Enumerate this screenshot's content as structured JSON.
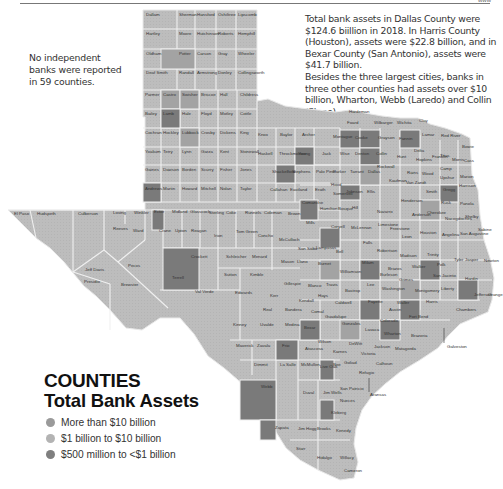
{
  "header": {
    "page_mark": "www"
  },
  "notes": {
    "left": "No independent banks were reported in 59 counties.",
    "right_p1": "Total bank assets in Dallas County were $124.6 biillion in 2018. In Harris County (Houston), assets were $22.8 billion, and in Bexar County (San Antonio), assets were $41.7 billion.",
    "right_p2": "Besides the three largest cities, banks in three other counties had assets over $10 billion, Wharton, Webb (Laredo) and Collin (Plano)."
  },
  "legend": {
    "title": "COUNTIES",
    "subtitle": "Total Bank Assets",
    "items": [
      {
        "label": "More than $10 billion",
        "color": "#9a9a9a"
      },
      {
        "label": "$1 billion to $10 billion",
        "color": "#b3b3b3"
      },
      {
        "label": "$500 million to <$1 billion",
        "color": "#7f7f7f"
      }
    ]
  },
  "colors": {
    "base": "#bdbdbd",
    "mid": "#a3a3a3",
    "dark": "#7a7a7a",
    "border": "#f2f2f2"
  },
  "map": {
    "panhandle_rows": [
      [
        "Dallam",
        "Sherman",
        "Hansford",
        "Ochiltree",
        "Lipscomb"
      ],
      [
        "Hartley",
        "Moore",
        "Hutchinson",
        "Roberts",
        "Hemphill"
      ],
      [
        "Oldham",
        "Potter",
        "Carson",
        "Gray",
        "Wheeler"
      ],
      [
        "Deaf Smith",
        "Randall",
        "Armstrong",
        "Donley",
        "Collingsworth"
      ],
      [
        "Parmer",
        "Castro",
        "Swisher",
        "Briscoe",
        "Hall",
        "Childress"
      ],
      [
        "Bailey",
        "Lamb",
        "Hale",
        "Floyd",
        "Motley",
        "Cottle"
      ],
      [
        "Cochran",
        "Hockley",
        "Lubbock",
        "Crosby",
        "Dickens",
        "King"
      ],
      [
        "Yoakum",
        "Terry",
        "Lynn",
        "Garza",
        "Kent",
        "Stonewall"
      ],
      [
        "Gaines",
        "Dawson",
        "Borden",
        "Scurry",
        "Fisher",
        "Jones"
      ],
      [
        "Andrews",
        "Martin",
        "Howard",
        "Mitchell",
        "Nolan",
        "Taylor"
      ]
    ],
    "labels": [
      {
        "name": "Hardeman",
        "x": 349,
        "y": 113
      },
      {
        "name": "Foard",
        "x": 347,
        "y": 124
      },
      {
        "name": "Wilbarger",
        "x": 374,
        "y": 124
      },
      {
        "name": "Wichita",
        "x": 397,
        "y": 124
      },
      {
        "name": "Clay",
        "x": 419,
        "y": 122
      },
      {
        "name": "Knox",
        "x": 258,
        "y": 136
      },
      {
        "name": "Baylor",
        "x": 280,
        "y": 136
      },
      {
        "name": "Archer",
        "x": 302,
        "y": 136
      },
      {
        "name": "Haskell",
        "x": 258,
        "y": 155
      },
      {
        "name": "Throckmorton",
        "x": 279,
        "y": 155
      },
      {
        "name": "Young",
        "x": 298,
        "y": 155
      },
      {
        "name": "Jack",
        "x": 322,
        "y": 155
      },
      {
        "name": "Wise",
        "x": 340,
        "y": 155
      },
      {
        "name": "Shackelford",
        "x": 272,
        "y": 173
      },
      {
        "name": "Stephens",
        "x": 292,
        "y": 173
      },
      {
        "name": "Palo Pinto",
        "x": 316,
        "y": 173
      },
      {
        "name": "Parker",
        "x": 333,
        "y": 173
      },
      {
        "name": "Tarrant",
        "x": 350,
        "y": 173
      },
      {
        "name": "Dallas",
        "x": 368,
        "y": 173
      },
      {
        "name": "Callahan",
        "x": 270,
        "y": 191
      },
      {
        "name": "Eastland",
        "x": 290,
        "y": 191
      },
      {
        "name": "Erath",
        "x": 315,
        "y": 191
      },
      {
        "name": "Montague",
        "x": 333,
        "y": 138
      },
      {
        "name": "Cooke",
        "x": 355,
        "y": 139
      },
      {
        "name": "Grayson",
        "x": 378,
        "y": 139
      },
      {
        "name": "Fannin",
        "x": 399,
        "y": 140
      },
      {
        "name": "Lamar",
        "x": 422,
        "y": 136
      },
      {
        "name": "Red River",
        "x": 441,
        "y": 137
      },
      {
        "name": "Bowie",
        "x": 462,
        "y": 148
      },
      {
        "name": "Denton",
        "x": 355,
        "y": 155
      },
      {
        "name": "Collin",
        "x": 376,
        "y": 155
      },
      {
        "name": "Hunt",
        "x": 397,
        "y": 158
      },
      {
        "name": "Delta",
        "x": 414,
        "y": 152
      },
      {
        "name": "Hopkins",
        "x": 416,
        "y": 161
      },
      {
        "name": "Franklin",
        "x": 432,
        "y": 158
      },
      {
        "name": "Titus",
        "x": 440,
        "y": 157
      },
      {
        "name": "Morris",
        "x": 452,
        "y": 161
      },
      {
        "name": "Cass",
        "x": 464,
        "y": 162
      },
      {
        "name": "Rockwall",
        "x": 377,
        "y": 168
      },
      {
        "name": "Kaufman",
        "x": 389,
        "y": 182
      },
      {
        "name": "Van Zandt",
        "x": 406,
        "y": 184
      },
      {
        "name": "Rains",
        "x": 407,
        "y": 174
      },
      {
        "name": "Wood",
        "x": 422,
        "y": 175
      },
      {
        "name": "Camp",
        "x": 440,
        "y": 170
      },
      {
        "name": "Upshur",
        "x": 440,
        "y": 179
      },
      {
        "name": "Marion",
        "x": 460,
        "y": 178
      },
      {
        "name": "Harrison",
        "x": 459,
        "y": 187
      },
      {
        "name": "Gregg",
        "x": 443,
        "y": 191
      },
      {
        "name": "Smith",
        "x": 426,
        "y": 193
      },
      {
        "name": "Ellis",
        "x": 367,
        "y": 193
      },
      {
        "name": "Johnson",
        "x": 346,
        "y": 193
      },
      {
        "name": "Hood",
        "x": 331,
        "y": 186
      },
      {
        "name": "Somervell",
        "x": 333,
        "y": 195
      },
      {
        "name": "Henderson",
        "x": 401,
        "y": 202
      },
      {
        "name": "Navarro",
        "x": 377,
        "y": 213
      },
      {
        "name": "Hill",
        "x": 352,
        "y": 209
      },
      {
        "name": "Rusk",
        "x": 441,
        "y": 204
      },
      {
        "name": "Panola",
        "x": 460,
        "y": 205
      },
      {
        "name": "Anderson",
        "x": 412,
        "y": 216
      },
      {
        "name": "Cherokee",
        "x": 427,
        "y": 214
      },
      {
        "name": "Nacogdoches",
        "x": 445,
        "y": 220
      },
      {
        "name": "Shelby",
        "x": 465,
        "y": 218
      },
      {
        "name": "El Paso",
        "x": 14,
        "y": 215
      },
      {
        "name": "Hudspeth",
        "x": 37,
        "y": 215
      },
      {
        "name": "Culberson",
        "x": 78,
        "y": 215
      },
      {
        "name": "Loving",
        "x": 113,
        "y": 214
      },
      {
        "name": "Winkler",
        "x": 134,
        "y": 214
      },
      {
        "name": "Ector",
        "x": 154,
        "y": 213
      },
      {
        "name": "Midland",
        "x": 172,
        "y": 213
      },
      {
        "name": "Glasscock",
        "x": 190,
        "y": 213
      },
      {
        "name": "Sterling",
        "x": 209,
        "y": 214
      },
      {
        "name": "Coke",
        "x": 226,
        "y": 214
      },
      {
        "name": "Runnels",
        "x": 245,
        "y": 214
      },
      {
        "name": "Coleman",
        "x": 264,
        "y": 214
      },
      {
        "name": "Brown",
        "x": 288,
        "y": 215
      },
      {
        "name": "Comanche",
        "x": 302,
        "y": 204
      },
      {
        "name": "Hamilton",
        "x": 320,
        "y": 210
      },
      {
        "name": "Bosque",
        "x": 338,
        "y": 210
      },
      {
        "name": "Mills",
        "x": 306,
        "y": 224
      },
      {
        "name": "Coryell",
        "x": 331,
        "y": 228
      },
      {
        "name": "McLennan",
        "x": 351,
        "y": 229
      },
      {
        "name": "Limestone",
        "x": 378,
        "y": 226
      },
      {
        "name": "Freestone",
        "x": 390,
        "y": 230
      },
      {
        "name": "Leon",
        "x": 402,
        "y": 238
      },
      {
        "name": "Houston",
        "x": 420,
        "y": 234
      },
      {
        "name": "Angelina",
        "x": 442,
        "y": 236
      },
      {
        "name": "San Augustine",
        "x": 460,
        "y": 235
      },
      {
        "name": "Sabine",
        "x": 478,
        "y": 231
      },
      {
        "name": "Falls",
        "x": 363,
        "y": 244
      },
      {
        "name": "Robertson",
        "x": 377,
        "y": 252
      },
      {
        "name": "Madison",
        "x": 400,
        "y": 257
      },
      {
        "name": "Trinity",
        "x": 427,
        "y": 256
      },
      {
        "name": "Polk",
        "x": 437,
        "y": 266
      },
      {
        "name": "Tyler",
        "x": 454,
        "y": 261
      },
      {
        "name": "Jasper",
        "x": 465,
        "y": 261
      },
      {
        "name": "Newton",
        "x": 484,
        "y": 262
      },
      {
        "name": "Reeves",
        "x": 113,
        "y": 230
      },
      {
        "name": "Ward",
        "x": 133,
        "y": 232
      },
      {
        "name": "Crane",
        "x": 159,
        "y": 232
      },
      {
        "name": "Upton",
        "x": 175,
        "y": 232
      },
      {
        "name": "Reagan",
        "x": 191,
        "y": 232
      },
      {
        "name": "Irion",
        "x": 214,
        "y": 237
      },
      {
        "name": "Tom Green",
        "x": 236,
        "y": 233
      },
      {
        "name": "Concho",
        "x": 258,
        "y": 237
      },
      {
        "name": "McCulloch",
        "x": 279,
        "y": 241
      },
      {
        "name": "San Saba",
        "x": 298,
        "y": 250
      },
      {
        "name": "Lampasas",
        "x": 316,
        "y": 249
      },
      {
        "name": "Bell",
        "x": 336,
        "y": 253
      },
      {
        "name": "Milam",
        "x": 362,
        "y": 264
      },
      {
        "name": "Burleson",
        "x": 380,
        "y": 276
      },
      {
        "name": "Brazos",
        "x": 388,
        "y": 270
      },
      {
        "name": "Grimes",
        "x": 399,
        "y": 281
      },
      {
        "name": "Walker",
        "x": 412,
        "y": 268
      },
      {
        "name": "San Jacinto",
        "x": 433,
        "y": 277
      },
      {
        "name": "Hardin",
        "x": 465,
        "y": 280
      },
      {
        "name": "Jefferson",
        "x": 474,
        "y": 296
      },
      {
        "name": "Orange",
        "x": 488,
        "y": 296
      },
      {
        "name": "Liberty",
        "x": 441,
        "y": 290
      },
      {
        "name": "Montgomery",
        "x": 415,
        "y": 292
      },
      {
        "name": "Harris",
        "x": 426,
        "y": 303
      },
      {
        "name": "Chambers",
        "x": 456,
        "y": 311
      },
      {
        "name": "Pecos",
        "x": 128,
        "y": 267
      },
      {
        "name": "Jeff Davis",
        "x": 85,
        "y": 271
      },
      {
        "name": "Presidio",
        "x": 84,
        "y": 283
      },
      {
        "name": "Brewster",
        "x": 121,
        "y": 286
      },
      {
        "name": "Terrell",
        "x": 172,
        "y": 279
      },
      {
        "name": "Crockett",
        "x": 191,
        "y": 258
      },
      {
        "name": "Schleicher",
        "x": 226,
        "y": 258
      },
      {
        "name": "Menard",
        "x": 252,
        "y": 258
      },
      {
        "name": "Mason",
        "x": 281,
        "y": 263
      },
      {
        "name": "Llano",
        "x": 297,
        "y": 263
      },
      {
        "name": "Burnet",
        "x": 318,
        "y": 265
      },
      {
        "name": "Williamson",
        "x": 340,
        "y": 273
      },
      {
        "name": "Lee",
        "x": 367,
        "y": 286
      },
      {
        "name": "Washington",
        "x": 382,
        "y": 290
      },
      {
        "name": "Waller",
        "x": 397,
        "y": 304
      },
      {
        "name": "Sutton",
        "x": 224,
        "y": 276
      },
      {
        "name": "Kimble",
        "x": 250,
        "y": 276
      },
      {
        "name": "Gillespie",
        "x": 284,
        "y": 285
      },
      {
        "name": "Blanco",
        "x": 308,
        "y": 287
      },
      {
        "name": "Travis",
        "x": 326,
        "y": 286
      },
      {
        "name": "Bastrop",
        "x": 345,
        "y": 292
      },
      {
        "name": "Fayette",
        "x": 368,
        "y": 303
      },
      {
        "name": "Austin",
        "x": 389,
        "y": 311
      },
      {
        "name": "Fort Bend",
        "x": 409,
        "y": 318
      },
      {
        "name": "Galveston",
        "x": 447,
        "y": 348
      },
      {
        "name": "Val Verde",
        "x": 195,
        "y": 293
      },
      {
        "name": "Edwards",
        "x": 235,
        "y": 294
      },
      {
        "name": "Kerr",
        "x": 270,
        "y": 297
      },
      {
        "name": "Kendall",
        "x": 299,
        "y": 302
      },
      {
        "name": "Hays",
        "x": 318,
        "y": 297
      },
      {
        "name": "Caldwell",
        "x": 335,
        "y": 304
      },
      {
        "name": "Colorado",
        "x": 380,
        "y": 322
      },
      {
        "name": "Wharton",
        "x": 384,
        "y": 335
      },
      {
        "name": "Brazoria",
        "x": 411,
        "y": 337
      },
      {
        "name": "Matagorda",
        "x": 395,
        "y": 350
      },
      {
        "name": "Real",
        "x": 263,
        "y": 311
      },
      {
        "name": "Bandera",
        "x": 285,
        "y": 311
      },
      {
        "name": "Comal",
        "x": 311,
        "y": 313
      },
      {
        "name": "Guadalupe",
        "x": 325,
        "y": 318
      },
      {
        "name": "Gonzales",
        "x": 342,
        "y": 325
      },
      {
        "name": "Lavaca",
        "x": 365,
        "y": 331
      },
      {
        "name": "Jackson",
        "x": 374,
        "y": 348
      },
      {
        "name": "Kinney",
        "x": 233,
        "y": 326
      },
      {
        "name": "Uvalde",
        "x": 260,
        "y": 326
      },
      {
        "name": "Medina",
        "x": 285,
        "y": 326
      },
      {
        "name": "Bexar",
        "x": 304,
        "y": 329
      },
      {
        "name": "Wilson",
        "x": 318,
        "y": 343
      },
      {
        "name": "Karnes",
        "x": 333,
        "y": 353
      },
      {
        "name": "DeWitt",
        "x": 349,
        "y": 345
      },
      {
        "name": "Victoria",
        "x": 361,
        "y": 355
      },
      {
        "name": "Calhoun",
        "x": 376,
        "y": 365
      },
      {
        "name": "Maverick",
        "x": 236,
        "y": 347
      },
      {
        "name": "Zavala",
        "x": 257,
        "y": 347
      },
      {
        "name": "Frio",
        "x": 282,
        "y": 347
      },
      {
        "name": "Atascosa",
        "x": 305,
        "y": 350
      },
      {
        "name": "Goliad",
        "x": 344,
        "y": 364
      },
      {
        "name": "Refugio",
        "x": 359,
        "y": 374
      },
      {
        "name": "Aransas",
        "x": 370,
        "y": 396
      },
      {
        "name": "Dimmit",
        "x": 254,
        "y": 366
      },
      {
        "name": "La Salle",
        "x": 280,
        "y": 366
      },
      {
        "name": "McMullen",
        "x": 301,
        "y": 366
      },
      {
        "name": "Live Oak",
        "x": 320,
        "y": 368
      },
      {
        "name": "Bee",
        "x": 333,
        "y": 366
      },
      {
        "name": "San Patricio",
        "x": 340,
        "y": 390
      },
      {
        "name": "Webb",
        "x": 261,
        "y": 388
      },
      {
        "name": "Duval",
        "x": 303,
        "y": 394
      },
      {
        "name": "Jim Wells",
        "x": 323,
        "y": 394
      },
      {
        "name": "Nueces",
        "x": 340,
        "y": 402
      },
      {
        "name": "Kleberg",
        "x": 331,
        "y": 414
      },
      {
        "name": "Zapata",
        "x": 275,
        "y": 429
      },
      {
        "name": "Jim Hogg",
        "x": 298,
        "y": 430
      },
      {
        "name": "Brooks",
        "x": 317,
        "y": 430
      },
      {
        "name": "Kenedy",
        "x": 336,
        "y": 432
      },
      {
        "name": "Starr",
        "x": 296,
        "y": 450
      },
      {
        "name": "Hidalgo",
        "x": 317,
        "y": 459
      },
      {
        "name": "Willacy",
        "x": 340,
        "y": 459
      },
      {
        "name": "Cameron",
        "x": 344,
        "y": 472
      }
    ]
  }
}
